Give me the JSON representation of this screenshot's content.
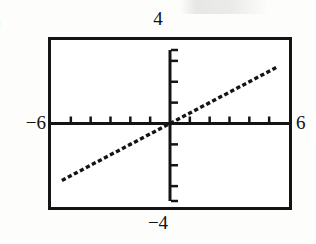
{
  "figure": {
    "name": "graphing-calculator-viewing-window",
    "margin_marker": ")",
    "background_color": "#fdfdfc",
    "ink_color": "#141414"
  },
  "labels": {
    "top": "4",
    "bottom": "−4",
    "left": "−6",
    "right": "6"
  },
  "chart_data": {
    "type": "line",
    "title": "",
    "subtitle": "",
    "xlabel": "",
    "ylabel": "",
    "xlim": [
      -6,
      6
    ],
    "ylim": [
      -4,
      4
    ],
    "grid": false,
    "legend": null,
    "axis_style": "centered-crosshair",
    "x_tick_interval": 1,
    "y_tick_interval": 1,
    "x_ticks": [
      -5,
      -4,
      -3,
      -2,
      -1,
      0,
      1,
      2,
      3,
      4,
      5
    ],
    "y_ticks": [
      -3,
      -2,
      -1,
      0,
      1,
      2,
      3
    ],
    "tick_labels_shown": false,
    "corner_labels": {
      "x_min": "−6",
      "x_max": "6",
      "y_min": "−4",
      "y_max": "4"
    },
    "series": [
      {
        "name": "y = 0.5x",
        "style": "dotted",
        "slope": 0.5,
        "intercept": 0,
        "x": [
          -5.45,
          -4.0,
          -3.0,
          -2.0,
          -1.0,
          0.0,
          1.0,
          2.0,
          3.0,
          4.0,
          5.45
        ],
        "values": [
          -2.73,
          -2.0,
          -1.5,
          -1.0,
          -0.5,
          0.0,
          0.5,
          1.0,
          1.5,
          2.0,
          2.73
        ]
      }
    ],
    "annotations": []
  }
}
